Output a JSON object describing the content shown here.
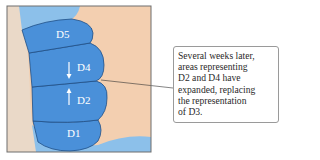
{
  "diagram": {
    "regions": [
      {
        "id": "D5",
        "label": "D5"
      },
      {
        "id": "D4",
        "label": "D4"
      },
      {
        "id": "D2",
        "label": "D2"
      },
      {
        "id": "D1",
        "label": "D1"
      }
    ],
    "arrows": [
      {
        "direction": "down",
        "region": "D4"
      },
      {
        "direction": "up",
        "region": "D2"
      }
    ],
    "colors": {
      "cortex_blue": "#4a90d9",
      "light_blue": "#8cc0ea",
      "skin_peach": "#f3cfb0",
      "tissue_edge": "#e8d6c4",
      "outline": "#1f4f86",
      "frame": "#6e6e6e"
    },
    "callout": {
      "lines": [
        "Several weeks later,",
        "areas representing",
        "D2 and D4 have",
        "expanded, replacing",
        "the representation",
        "of D3."
      ]
    }
  }
}
